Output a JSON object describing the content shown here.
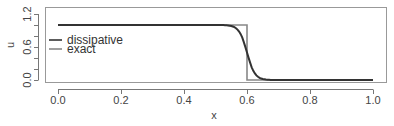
{
  "chart_data": {
    "type": "line",
    "title": "",
    "xlabel": "x",
    "ylabel": "u",
    "xlim": [
      0.0,
      1.0
    ],
    "ylim": [
      0.0,
      1.2
    ],
    "xticks": [
      "0.0",
      "0.2",
      "0.4",
      "0.6",
      "0.8",
      "1.0"
    ],
    "yticks": [
      "0.0",
      "0.6",
      "1.2"
    ],
    "yminor_ticks": [
      0.0,
      0.2,
      0.4,
      0.6,
      0.8,
      1.0,
      1.2
    ],
    "grid": false,
    "legend_position": "left-middle inside",
    "series": [
      {
        "name": "dissipative",
        "color": "#333333",
        "x": [
          0.0,
          0.5,
          0.54,
          0.56,
          0.58,
          0.6,
          0.62,
          0.64,
          0.66,
          0.68,
          0.7,
          1.0
        ],
        "y": [
          1.0,
          1.0,
          0.99,
          0.95,
          0.8,
          0.5,
          0.22,
          0.07,
          0.02,
          0.005,
          0.0,
          0.0
        ]
      },
      {
        "name": "exact",
        "color": "#888888",
        "x": [
          0.0,
          0.6,
          0.6,
          1.0
        ],
        "y": [
          1.0,
          1.0,
          0.0,
          0.0
        ]
      }
    ]
  },
  "legend": {
    "items": [
      {
        "label": "dissipative",
        "color": "#333333"
      },
      {
        "label": "exact",
        "color": "#888888"
      }
    ]
  },
  "axes": {
    "xlabel": "x",
    "ylabel": "u",
    "xticks": [
      "0.0",
      "0.2",
      "0.4",
      "0.6",
      "0.8",
      "1.0"
    ],
    "yticks": [
      "0.0",
      "0.6",
      "1.2"
    ]
  }
}
